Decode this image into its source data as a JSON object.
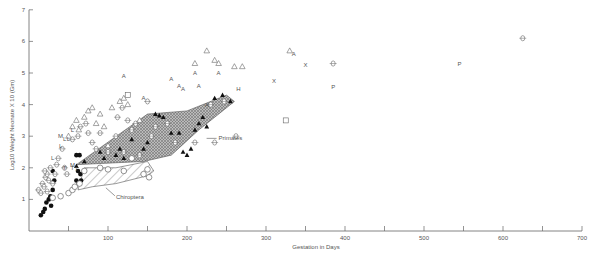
{
  "chart_data": {
    "type": "scatter",
    "title": "",
    "xlabel": "Gestation in Days",
    "ylabel": "Log10 Weight Neonate X 10 (Gm)",
    "xlim": [
      0,
      700
    ],
    "ylim": [
      0,
      7
    ],
    "x_ticks": [
      50,
      100,
      150,
      200,
      250,
      300,
      350,
      400,
      450,
      500,
      550,
      600,
      650,
      700
    ],
    "x_tick_labels": [
      "100",
      "200",
      "300",
      "400",
      "500",
      "600",
      "700"
    ],
    "x_tick_label_values": [
      100,
      200,
      300,
      400,
      500,
      600,
      700
    ],
    "y_ticks": [
      1,
      2,
      3,
      4,
      5,
      6,
      7
    ],
    "y_tick_labels": [
      "1",
      "2",
      "3",
      "4",
      "5",
      "6",
      "7"
    ],
    "grid": false,
    "annotations": [
      {
        "text": "Primates",
        "x": 240,
        "y": 2.9
      },
      {
        "text": "Chiroptera",
        "x": 110,
        "y": 1.05
      }
    ],
    "regions": [
      {
        "name": "Primates",
        "fill": "crosshatch",
        "polygon": [
          [
            60,
            2.1
          ],
          [
            150,
            3.7
          ],
          [
            200,
            3.8
          ],
          [
            250,
            4.3
          ],
          [
            260,
            4.1
          ],
          [
            215,
            3.2
          ],
          [
            180,
            2.4
          ],
          [
            145,
            2.2
          ]
        ]
      },
      {
        "name": "Chiroptera",
        "fill": "diagonal",
        "polygon": [
          [
            62,
            1.3
          ],
          [
            70,
            2.0
          ],
          [
            110,
            2.0
          ],
          [
            150,
            2.2
          ],
          [
            158,
            1.9
          ],
          [
            150,
            1.75
          ],
          [
            110,
            1.5
          ],
          [
            80,
            1.4
          ]
        ]
      }
    ],
    "series": [
      {
        "name": "filled-circle",
        "marker": "●",
        "points": [
          [
            15,
            0.5
          ],
          [
            18,
            0.6
          ],
          [
            20,
            0.7
          ],
          [
            22,
            0.9
          ],
          [
            25,
            1.0
          ],
          [
            27,
            1.1
          ],
          [
            30,
            1.3
          ],
          [
            28,
            0.8
          ],
          [
            32,
            1.6
          ],
          [
            30,
            1.9
          ],
          [
            60,
            2.4
          ],
          [
            64,
            2.4
          ],
          [
            62,
            1.9
          ],
          [
            65,
            1.8
          ],
          [
            60,
            1.6
          ],
          [
            66,
            1.6
          ],
          [
            63,
            1.5
          ]
        ]
      },
      {
        "name": "open-circle",
        "marker": "○",
        "points": [
          [
            30,
            1.05
          ],
          [
            40,
            1.1
          ],
          [
            50,
            1.2
          ],
          [
            55,
            1.3
          ],
          [
            58,
            1.4
          ],
          [
            64,
            1.5
          ],
          [
            70,
            1.9
          ],
          [
            90,
            2.0
          ],
          [
            100,
            1.95
          ],
          [
            120,
            1.9
          ],
          [
            130,
            2.3
          ],
          [
            145,
            1.8
          ],
          [
            150,
            1.95
          ],
          [
            152,
            1.7
          ]
        ]
      },
      {
        "name": "open-diamond",
        "marker": "◇",
        "points": [
          [
            12,
            1.3
          ],
          [
            15,
            1.2
          ],
          [
            17,
            1.5
          ],
          [
            19,
            1.4
          ],
          [
            21,
            1.7
          ],
          [
            23,
            1.8
          ],
          [
            25,
            1.6
          ],
          [
            27,
            2.0
          ],
          [
            20,
            1.9
          ],
          [
            23,
            1.25
          ],
          [
            30,
            1.5
          ],
          [
            33,
            1.8
          ],
          [
            35,
            2.1
          ],
          [
            37,
            2.3
          ],
          [
            42,
            2.6
          ],
          [
            45,
            2.0
          ],
          [
            48,
            1.8
          ],
          [
            55,
            2.9
          ],
          [
            62,
            3.0
          ],
          [
            65,
            3.3
          ],
          [
            72,
            3.4
          ],
          [
            75,
            3.1
          ],
          [
            80,
            2.8
          ],
          [
            85,
            2.6
          ],
          [
            90,
            3.1
          ],
          [
            100,
            2.5
          ],
          [
            110,
            3.0
          ],
          [
            112,
            3.6
          ],
          [
            118,
            3.9
          ],
          [
            120,
            2.5
          ],
          [
            125,
            3.5
          ],
          [
            130,
            3.2
          ],
          [
            135,
            3.4
          ],
          [
            140,
            2.4
          ],
          [
            150,
            4.1
          ],
          [
            155,
            3.0
          ],
          [
            160,
            3.3
          ],
          [
            175,
            3.4
          ],
          [
            185,
            2.8
          ],
          [
            210,
            2.8
          ],
          [
            230,
            4.0
          ],
          [
            235,
            2.8
          ],
          [
            247,
            4.1
          ],
          [
            262,
            3.0
          ],
          [
            385,
            5.3
          ],
          [
            625,
            6.1
          ]
        ]
      },
      {
        "name": "open-triangle",
        "marker": "△",
        "points": [
          [
            50,
            3.0
          ],
          [
            55,
            3.3
          ],
          [
            60,
            3.5
          ],
          [
            63,
            3.2
          ],
          [
            70,
            3.6
          ],
          [
            75,
            3.8
          ],
          [
            80,
            3.9
          ],
          [
            85,
            3.4
          ],
          [
            90,
            3.7
          ],
          [
            95,
            3.3
          ],
          [
            100,
            2.7
          ],
          [
            105,
            3.9
          ],
          [
            115,
            4.1
          ],
          [
            120,
            4.2
          ],
          [
            125,
            4.0
          ],
          [
            140,
            3.5
          ],
          [
            210,
            5.3
          ],
          [
            225,
            5.7
          ],
          [
            235,
            5.4
          ],
          [
            240,
            5.3
          ],
          [
            260,
            5.2
          ],
          [
            270,
            5.2
          ],
          [
            330,
            5.7
          ]
        ]
      },
      {
        "name": "filled-triangle",
        "marker": "▲",
        "points": [
          [
            60,
            2.05
          ],
          [
            70,
            2.2
          ],
          [
            90,
            2.5
          ],
          [
            95,
            2.3
          ],
          [
            110,
            2.4
          ],
          [
            115,
            2.6
          ],
          [
            120,
            2.3
          ],
          [
            130,
            2.9
          ],
          [
            145,
            2.6
          ],
          [
            150,
            2.8
          ],
          [
            160,
            3.7
          ],
          [
            165,
            3.65
          ],
          [
            170,
            3.6
          ],
          [
            180,
            3.1
          ],
          [
            190,
            3.1
          ],
          [
            195,
            2.5
          ],
          [
            200,
            2.4
          ],
          [
            205,
            2.6
          ],
          [
            210,
            3.2
          ],
          [
            215,
            3.4
          ],
          [
            220,
            3.6
          ],
          [
            225,
            3.3
          ],
          [
            235,
            4.2
          ],
          [
            245,
            4.3
          ],
          [
            255,
            4.1
          ]
        ]
      },
      {
        "name": "letter-A",
        "marker": "A",
        "points": [
          [
            120,
            4.9
          ],
          [
            180,
            4.8
          ],
          [
            190,
            4.6
          ],
          [
            195,
            4.5
          ],
          [
            210,
            5.0
          ],
          [
            215,
            4.6
          ],
          [
            225,
            4.0
          ],
          [
            240,
            5.0
          ],
          [
            145,
            4.2
          ],
          [
            335,
            5.6
          ]
        ]
      },
      {
        "name": "letter-X",
        "marker": "X",
        "points": [
          [
            310,
            4.75
          ],
          [
            350,
            5.25
          ]
        ]
      },
      {
        "name": "letter-P",
        "marker": "P",
        "points": [
          [
            385,
            4.55
          ],
          [
            545,
            5.3
          ]
        ]
      },
      {
        "name": "letter-H",
        "marker": "H",
        "points": [
          [
            265,
            4.5
          ]
        ]
      },
      {
        "name": "letter-L",
        "marker": "L",
        "points": [
          [
            40,
            2.7
          ],
          [
            45,
            2.9
          ],
          [
            50,
            2.9
          ],
          [
            55,
            3.2
          ],
          [
            30,
            2.3
          ]
        ]
      },
      {
        "name": "letter-M",
        "marker": "M",
        "points": [
          [
            40,
            3.0
          ],
          [
            55,
            2.1
          ]
        ]
      },
      {
        "name": "letter-T",
        "marker": "T",
        "points": [
          [
            45,
            2.0
          ],
          [
            55,
            2.0
          ],
          [
            60,
            1.95
          ]
        ]
      },
      {
        "name": "open-square",
        "marker": "□",
        "points": [
          [
            125,
            4.3
          ],
          [
            325,
            3.5
          ]
        ]
      }
    ]
  },
  "axes": {
    "xlabel": "Gestation in Days",
    "ylabel": "Log10 Weight Neonate X 10 (Gm)"
  }
}
